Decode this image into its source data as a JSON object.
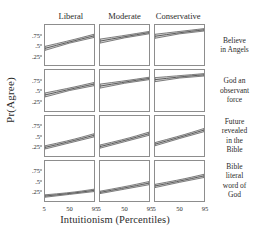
{
  "chart_data": {
    "type": "line",
    "title": "",
    "xlabel": "Intuitionism (Percentiles)",
    "ylabel": "Pr(Agree)",
    "grid": false,
    "legend": "none",
    "facet_layout": "4 rows x 3 columns",
    "xlim": [
      5,
      95
    ],
    "ylim": [
      0,
      1
    ],
    "xticks": [
      5,
      50,
      95
    ],
    "xticklabels": [
      "5",
      "50",
      "95"
    ],
    "yticks": [
      0.25,
      0.5,
      0.75
    ],
    "yticklabels": [
      ".25",
      ".5",
      ".75"
    ],
    "columns": [
      "Liberal",
      "Moderate",
      "Conservative"
    ],
    "rows": [
      "Believe in Angels",
      "God an observant force",
      "Future revealed in the Bible",
      "Bible literal word of God"
    ],
    "row_labels_lines": [
      [
        "Believe",
        "in Angels"
      ],
      [
        "God an",
        "observant",
        "force"
      ],
      [
        "Future",
        "revealed",
        "in the",
        "Bible"
      ],
      [
        "Bible",
        "literal",
        "word of",
        "God"
      ]
    ],
    "series_style": {
      "line_color": "#4d4d4d",
      "band_color": "#b9b9b9",
      "band_label": "95% confidence interval"
    },
    "panels": [
      {
        "row": "Believe in Angels",
        "column": "Liberal",
        "x": [
          5,
          50,
          95
        ],
        "fit": [
          0.42,
          0.58,
          0.73
        ],
        "lower": [
          0.37,
          0.55,
          0.69
        ],
        "upper": [
          0.47,
          0.61,
          0.77
        ]
      },
      {
        "row": "Believe in Angels",
        "column": "Moderate",
        "x": [
          5,
          50,
          95
        ],
        "fit": [
          0.6,
          0.71,
          0.81
        ],
        "lower": [
          0.55,
          0.68,
          0.78
        ],
        "upper": [
          0.65,
          0.74,
          0.84
        ]
      },
      {
        "row": "Believe in Angels",
        "column": "Conservative",
        "x": [
          5,
          50,
          95
        ],
        "fit": [
          0.72,
          0.81,
          0.88
        ],
        "lower": [
          0.67,
          0.78,
          0.85
        ],
        "upper": [
          0.77,
          0.84,
          0.91
        ]
      },
      {
        "row": "God an observant force",
        "column": "Liberal",
        "x": [
          5,
          50,
          95
        ],
        "fit": [
          0.38,
          0.52,
          0.65
        ],
        "lower": [
          0.33,
          0.49,
          0.61
        ],
        "upper": [
          0.43,
          0.55,
          0.69
        ]
      },
      {
        "row": "God an observant force",
        "column": "Moderate",
        "x": [
          5,
          50,
          95
        ],
        "fit": [
          0.6,
          0.7,
          0.79
        ],
        "lower": [
          0.55,
          0.67,
          0.76
        ],
        "upper": [
          0.65,
          0.73,
          0.82
        ]
      },
      {
        "row": "God an observant force",
        "column": "Conservative",
        "x": [
          5,
          50,
          95
        ],
        "fit": [
          0.76,
          0.83,
          0.88
        ],
        "lower": [
          0.71,
          0.8,
          0.85
        ],
        "upper": [
          0.81,
          0.86,
          0.91
        ]
      },
      {
        "row": "Future revealed in the Bible",
        "column": "Liberal",
        "x": [
          5,
          50,
          95
        ],
        "fit": [
          0.22,
          0.36,
          0.52
        ],
        "lower": [
          0.18,
          0.33,
          0.48
        ],
        "upper": [
          0.26,
          0.39,
          0.56
        ]
      },
      {
        "row": "Future revealed in the Bible",
        "column": "Moderate",
        "x": [
          5,
          50,
          95
        ],
        "fit": [
          0.24,
          0.39,
          0.56
        ],
        "lower": [
          0.2,
          0.36,
          0.52
        ],
        "upper": [
          0.28,
          0.42,
          0.6
        ]
      },
      {
        "row": "Future revealed in the Bible",
        "column": "Conservative",
        "x": [
          5,
          50,
          95
        ],
        "fit": [
          0.3,
          0.47,
          0.65
        ],
        "lower": [
          0.26,
          0.44,
          0.61
        ],
        "upper": [
          0.34,
          0.5,
          0.69
        ]
      },
      {
        "row": "Bible literal word of God",
        "column": "Liberal",
        "x": [
          5,
          50,
          95
        ],
        "fit": [
          0.13,
          0.19,
          0.27
        ],
        "lower": [
          0.1,
          0.17,
          0.24
        ],
        "upper": [
          0.16,
          0.21,
          0.3
        ]
      },
      {
        "row": "Bible literal word of God",
        "column": "Moderate",
        "x": [
          5,
          50,
          95
        ],
        "fit": [
          0.22,
          0.33,
          0.45
        ],
        "lower": [
          0.19,
          0.3,
          0.41
        ],
        "upper": [
          0.25,
          0.36,
          0.49
        ]
      },
      {
        "row": "Bible literal word of God",
        "column": "Conservative",
        "x": [
          5,
          50,
          95
        ],
        "fit": [
          0.38,
          0.5,
          0.63
        ],
        "lower": [
          0.34,
          0.47,
          0.59
        ],
        "upper": [
          0.42,
          0.53,
          0.67
        ]
      }
    ]
  }
}
